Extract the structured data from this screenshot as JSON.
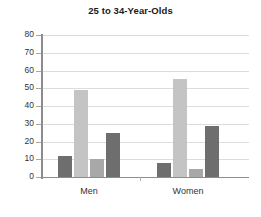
{
  "chart_data": {
    "type": "bar",
    "title": "25 to 34-Year-Olds",
    "xlabel": "",
    "ylabel": "",
    "ylim": [
      0,
      80
    ],
    "ytick_step": 10,
    "yticks": [
      "80",
      "70",
      "60",
      "50",
      "40",
      "30",
      "20",
      "10",
      "0"
    ],
    "grid": true,
    "legend": "none",
    "categories": [
      "Men",
      "Women"
    ],
    "series": [
      {
        "name": "series-1",
        "color": "#6e6e6e",
        "values": [
          12,
          8
        ]
      },
      {
        "name": "series-2",
        "color": "#c4c4c4",
        "values": [
          49,
          55
        ]
      },
      {
        "name": "series-3",
        "color": "#a8a8a8",
        "values": [
          10,
          4.5
        ]
      },
      {
        "name": "series-4",
        "color": "#6e6e6e",
        "values": [
          25,
          29
        ]
      }
    ],
    "colors": {
      "axis": "#8c8c8c",
      "grid": "#dcdcdc",
      "text": "#333333",
      "title": "#1a1a1a",
      "background": "#ffffff"
    }
  }
}
